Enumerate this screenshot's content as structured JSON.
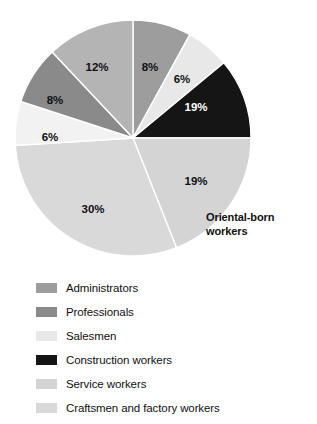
{
  "chart_data": {
    "type": "pie",
    "title": "",
    "annotation": "Oriental-born workers",
    "legend_position": "bottom",
    "center": {
      "cx": 133,
      "cy": 138,
      "r": 118
    },
    "slices": [
      {
        "label": "Administrators",
        "value": 8,
        "display": "8%",
        "color": "#9d9d9d",
        "start_angle": 0,
        "end_angle": 28.8,
        "label_x": 150,
        "label_y": 68,
        "label_color": "dark"
      },
      {
        "label": "Salesmen",
        "value": 6,
        "display": "6%",
        "color": "#e8e8e8",
        "start_angle": 28.8,
        "end_angle": 50.4,
        "label_x": 182,
        "label_y": 80,
        "label_color": "dark"
      },
      {
        "label": "Construction workers",
        "value": 19,
        "display": "19%",
        "color": "#151515",
        "start_angle": 50.4,
        "end_angle": 90.0,
        "label_x": 196,
        "label_y": 108,
        "label_color": "light"
      },
      {
        "label": "Service workers",
        "value": 19,
        "display": "19%",
        "color": "#d4d4d4",
        "start_angle": 90.0,
        "end_angle": 158.4,
        "label_x": 196,
        "label_y": 182,
        "label_color": "dark"
      },
      {
        "label": "Craftsmen and factory workers",
        "value": 30,
        "display": "30%",
        "color": "#d9d9d9",
        "start_angle": 158.4,
        "end_angle": 266.4,
        "label_x": 93,
        "label_y": 210,
        "label_color": "dark"
      },
      {
        "label": "Salesmen",
        "value": 6,
        "display": "6%",
        "color": "#f2f2f2",
        "start_angle": 266.4,
        "end_angle": 288.0,
        "label_x": 50,
        "label_y": 138,
        "label_color": "dark"
      },
      {
        "label": "Professionals",
        "value": 8,
        "display": "8%",
        "color": "#8a8a8a",
        "start_angle": 288.0,
        "end_angle": 316.8,
        "label_x": 55,
        "label_y": 101,
        "label_color": "dark"
      },
      {
        "label": "Administrators",
        "value": 12,
        "display": "12%",
        "color": "#b4b4b4",
        "start_angle": 316.8,
        "end_angle": 360.0,
        "label_x": 97,
        "label_y": 68,
        "label_color": "dark"
      }
    ]
  },
  "legend": {
    "items": [
      {
        "label": "Administrators",
        "color": "#9d9d9d"
      },
      {
        "label": "Professionals",
        "color": "#8a8a8a"
      },
      {
        "label": "Salesmen",
        "color": "#e8e8e8"
      },
      {
        "label": "Construction workers",
        "color": "#151515"
      },
      {
        "label": "Service workers",
        "color": "#d4d4d4"
      },
      {
        "label": "Craftsmen and factory workers",
        "color": "#d9d9d9"
      }
    ]
  }
}
